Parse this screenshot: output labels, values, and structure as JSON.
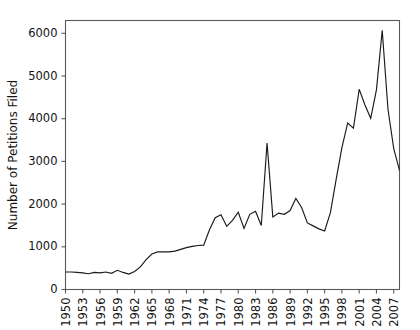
{
  "chart_data": {
    "type": "line",
    "title": "",
    "xlabel": "",
    "ylabel": "Number of Petitions Filed",
    "xlim": [
      1950,
      2008
    ],
    "ylim": [
      0,
      6300
    ],
    "grid": false,
    "legend": null,
    "y_ticks": [
      0,
      1000,
      2000,
      3000,
      4000,
      5000,
      6000
    ],
    "y_tick_labels": [
      "0",
      "1000",
      "2000",
      "3000",
      "4000",
      "5000",
      "6000"
    ],
    "x_ticks": [
      1950,
      1953,
      1956,
      1959,
      1962,
      1965,
      1968,
      1971,
      1974,
      1977,
      1980,
      1983,
      1986,
      1989,
      1992,
      1995,
      1998,
      2001,
      2004,
      2007
    ],
    "x_tick_labels": [
      "1950",
      "1953",
      "1956",
      "1959",
      "1962",
      "1965",
      "1968",
      "1971",
      "1974",
      "1977",
      "1980",
      "1983",
      "1986",
      "1989",
      "1992",
      "1995",
      "1998",
      "2001",
      "2004",
      "2007"
    ],
    "series_name": "Petitions Filed",
    "line_color": "#1a1a1a",
    "x": [
      1950,
      1951,
      1952,
      1953,
      1954,
      1955,
      1956,
      1957,
      1958,
      1959,
      1960,
      1961,
      1962,
      1963,
      1964,
      1965,
      1966,
      1967,
      1968,
      1969,
      1970,
      1971,
      1972,
      1973,
      1974,
      1975,
      1976,
      1977,
      1978,
      1979,
      1980,
      1981,
      1982,
      1983,
      1984,
      1985,
      1986,
      1987,
      1988,
      1989,
      1990,
      1991,
      1992,
      1993,
      1994,
      1995,
      1996,
      1997,
      1998,
      1999,
      2000,
      2001,
      2002,
      2003,
      2004,
      2005,
      2006,
      2007,
      2008
    ],
    "values": [
      410,
      410,
      400,
      390,
      370,
      400,
      390,
      410,
      380,
      450,
      400,
      360,
      420,
      530,
      700,
      830,
      880,
      880,
      880,
      900,
      940,
      980,
      1010,
      1030,
      1040,
      1400,
      1680,
      1750,
      1480,
      1620,
      1810,
      1430,
      1760,
      1830,
      1500,
      3430,
      1700,
      1790,
      1760,
      1850,
      2130,
      1920,
      1560,
      1490,
      1420,
      1370,
      1800,
      2580,
      3320,
      3900,
      3780,
      4690,
      4320,
      4010,
      4680,
      6070,
      4220,
      3300,
      2790
    ]
  },
  "axis": {
    "y_title": "Number of Petitions Filed"
  }
}
